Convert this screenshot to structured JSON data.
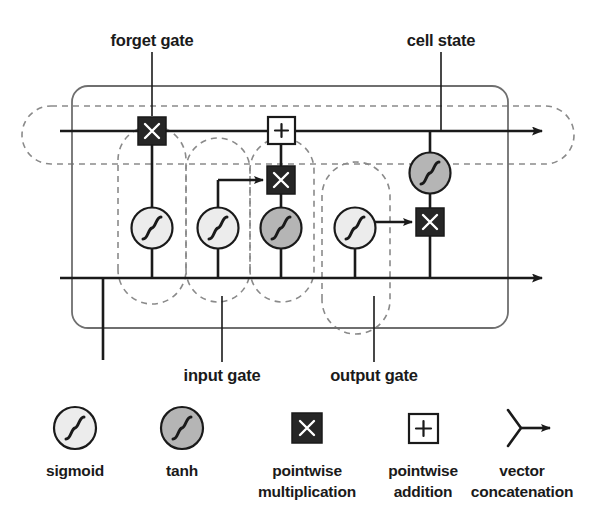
{
  "figure": {
    "type": "lstm-cell-diagram",
    "title_visible": false,
    "background_color": "#ffffff",
    "line_color": "#1a1a1a",
    "dashed_color": "#8a8a8a",
    "sigmoid_fill": "#ececec",
    "tanh_fill": "#b5b5b5",
    "mult_fill": "#262626",
    "add_fill": "#ffffff"
  },
  "annotations": [
    {
      "id": "forget-gate",
      "label": "forget gate",
      "x": 152,
      "y": 42,
      "leader_x": 152,
      "leader_y1": 52,
      "leader_y2": 116
    },
    {
      "id": "cell-state",
      "label": "cell state",
      "x": 441,
      "y": 42,
      "leader_x": 441,
      "leader_y1": 52,
      "leader_y2": 130
    },
    {
      "id": "input-gate",
      "label": "input gate",
      "x": 222,
      "y": 375,
      "leader_x": 222,
      "leader_y1": 296,
      "leader_y2": 362
    },
    {
      "id": "output-gate",
      "label": "output gate",
      "x": 374,
      "y": 375,
      "leader_x": 374,
      "leader_y1": 296,
      "leader_y2": 362
    }
  ],
  "nodes": [
    {
      "id": "forget-mult",
      "kind": "pointwise-multiplication",
      "x": 152,
      "y": 131
    },
    {
      "id": "cell-add",
      "kind": "pointwise-addition",
      "x": 281,
      "y": 130
    },
    {
      "id": "input-mult",
      "kind": "pointwise-multiplication",
      "x": 281,
      "y": 180
    },
    {
      "id": "output-mult",
      "kind": "pointwise-multiplication",
      "x": 430,
      "y": 222
    },
    {
      "id": "forget-sigmoid",
      "kind": "sigmoid",
      "x": 152,
      "y": 228
    },
    {
      "id": "input-sigmoid",
      "kind": "sigmoid",
      "x": 218,
      "y": 228
    },
    {
      "id": "candidate-tanh",
      "kind": "tanh",
      "x": 281,
      "y": 228
    },
    {
      "id": "output-sigmoid",
      "kind": "sigmoid",
      "x": 355,
      "y": 228
    },
    {
      "id": "cellstate-tanh",
      "kind": "tanh",
      "x": 430,
      "y": 173
    }
  ],
  "legend": {
    "items": [
      {
        "id": "legend-sigmoid",
        "icon": "sigmoid-icon",
        "lines": [
          "sigmoid"
        ],
        "x": 75,
        "icon_y": 428,
        "text_y": 470
      },
      {
        "id": "legend-tanh",
        "icon": "tanh-icon",
        "lines": [
          "tanh"
        ],
        "x": 182,
        "icon_y": 428,
        "text_y": 470
      },
      {
        "id": "legend-pointwise-multiplication",
        "icon": "pointwise-multiplication-icon",
        "lines": [
          "pointwise",
          "multiplication"
        ],
        "x": 307,
        "icon_y": 428,
        "text_y": 470
      },
      {
        "id": "legend-pointwise-addition",
        "icon": "pointwise-addition-icon",
        "lines": [
          "pointwise",
          "addition"
        ],
        "x": 423,
        "icon_y": 428,
        "text_y": 470
      },
      {
        "id": "legend-vector-concatenation",
        "icon": "vector-concatenation-icon",
        "lines": [
          "vector",
          "concatenation"
        ],
        "x": 522,
        "icon_y": 428,
        "text_y": 470
      }
    ]
  }
}
